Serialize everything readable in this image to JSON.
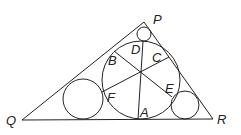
{
  "diagram": {
    "type": "geometry",
    "labels": {
      "P": "P",
      "Q": "Q",
      "R": "R",
      "A": "A",
      "B": "B",
      "C": "C",
      "D": "D",
      "E": "E",
      "F": "F"
    },
    "colors": {
      "stroke": "#222222",
      "background": "#ffffff"
    }
  }
}
